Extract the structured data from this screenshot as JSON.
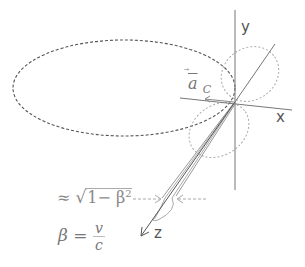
{
  "diagram": {
    "axes": {
      "x_label": "x",
      "y_label": "y",
      "z_label": "z"
    },
    "vector_label": {
      "symbol": "a",
      "subscript": "C"
    },
    "annotations": {
      "width_prefix": "≈",
      "width_sqrt_body": "1− β",
      "width_exp": "2",
      "beta_symbol": "β",
      "beta_equals": "=",
      "beta_num": "v",
      "beta_den": "c"
    },
    "elements": [
      "large dashed ellipse (low-velocity pattern, along -x)",
      "dotted dipole lobes near origin",
      "narrow forward cone along z"
    ],
    "colors": {
      "axis": "#777777",
      "dashed_ellipse": "#555555",
      "dotted_lobes": "#aaaaaa",
      "cone": "#888888",
      "text": "#555555"
    }
  }
}
